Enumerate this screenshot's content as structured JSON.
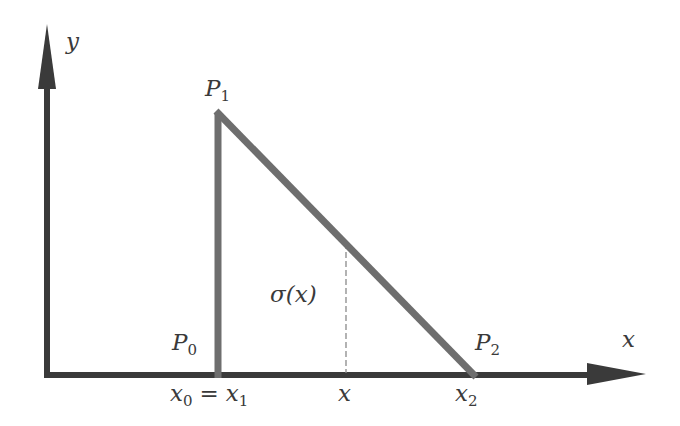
{
  "diagram": {
    "type": "linear-spline-triangle",
    "colors": {
      "axes": "#3a3a3a",
      "curve": "#6e6e6e",
      "dashed": "#8a8a8a",
      "text": "#3a3a3a",
      "background": "#ffffff"
    },
    "axes": {
      "x_label": "x",
      "y_label": "y"
    },
    "points": [
      {
        "name": "P",
        "sub": "0",
        "id": "P0"
      },
      {
        "name": "P",
        "sub": "1",
        "id": "P1"
      },
      {
        "name": "P",
        "sub": "2",
        "id": "P2"
      }
    ],
    "function_label": {
      "text": "σ(x)"
    },
    "x_ticks": [
      {
        "id": "x0_eq_x1",
        "left": "x",
        "left_sub": "0",
        "eq": "=",
        "right": "x",
        "right_sub": "1"
      },
      {
        "id": "x",
        "text": "x"
      },
      {
        "id": "x2",
        "name": "x",
        "sub": "2"
      }
    ]
  }
}
